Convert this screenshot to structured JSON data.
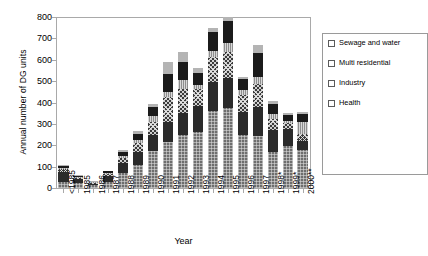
{
  "chart_data": {
    "type": "bar",
    "subtype": "stacked-bar",
    "title": "",
    "xlabel": "Year",
    "ylabel": "Annual number of DG units",
    "ylim": [
      0,
      800
    ],
    "yticks": [
      0,
      100,
      200,
      300,
      400,
      500,
      600,
      700,
      800
    ],
    "grid": false,
    "legend_position": "right",
    "categories": [
      "<1985",
      "1985",
      "1986",
      "1987",
      "1988",
      "1989",
      "1990",
      "1991",
      "1992",
      "1993",
      "1994",
      "1995",
      "1996",
      "1997",
      "1998*",
      "1999*",
      "2000**"
    ],
    "series": [
      {
        "name": "Agriculture",
        "pattern": "fine-grid-gray",
        "values": [
          30,
          25,
          12,
          30,
          70,
          110,
          175,
          215,
          250,
          260,
          360,
          375,
          250,
          245,
          170,
          195,
          180
        ]
      },
      {
        "name": "Leisure, hotels, offices, education",
        "pattern": "solid-dark",
        "values": [
          45,
          15,
          8,
          25,
          45,
          60,
          75,
          95,
          100,
          125,
          135,
          140,
          105,
          135,
          100,
          80,
          40
        ]
      },
      {
        "name": "Health",
        "pattern": "checker-dark",
        "values": [
          15,
          8,
          5,
          10,
          25,
          40,
          60,
          115,
          115,
          80,
          120,
          120,
          80,
          105,
          55,
          30,
          35
        ]
      },
      {
        "name": "Industry",
        "pattern": "vertical-stripe",
        "values": [
          5,
          4,
          2,
          5,
          10,
          15,
          25,
          25,
          40,
          15,
          25,
          45,
          25,
          35,
          20,
          10,
          55
        ]
      },
      {
        "name": "Multi residential",
        "pattern": "solid-black",
        "values": [
          8,
          5,
          3,
          8,
          20,
          30,
          45,
          85,
          85,
          60,
          90,
          100,
          50,
          110,
          50,
          25,
          35
        ]
      },
      {
        "name": "Sewage and water",
        "pattern": "light-gray",
        "values": [
          7,
          3,
          2,
          4,
          8,
          10,
          15,
          55,
          45,
          20,
          20,
          20,
          10,
          40,
          10,
          10,
          10
        ]
      }
    ],
    "totals": [
      110,
      60,
      32,
      82,
      178,
      265,
      395,
      590,
      635,
      560,
      750,
      800,
      520,
      670,
      405,
      350,
      355
    ]
  },
  "axes": {
    "y_title": "Annual number of DG units",
    "x_title": "Year"
  },
  "legend": {
    "items": [
      {
        "label": "Sewage and water",
        "swatch": "light-gray-swatch"
      },
      {
        "label": "Multi residential",
        "swatch": "solid-black-swatch"
      },
      {
        "label": "Industry",
        "swatch": "vertical-stripe-swatch"
      },
      {
        "label": "Health",
        "swatch": "checker-dark-swatch"
      },
      {
        "label": "Leisure, hotels,\noffices, education",
        "swatch": "solid-dark-swatch",
        "line1": "Leisure, hotels,",
        "line2": "offices, education"
      },
      {
        "label": "Agriculture",
        "swatch": "fine-grid-gray-swatch"
      }
    ]
  }
}
